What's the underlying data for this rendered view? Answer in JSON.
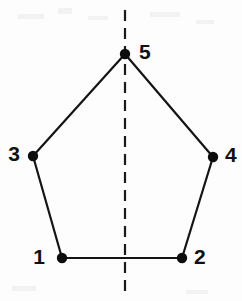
{
  "figure": {
    "background_color": "#fdfdfd",
    "stroke_color": "#141414",
    "vertex_color": "#0d0d0d",
    "axis_color": "#1a1a1a"
  },
  "axis": {
    "name": "mirror-line",
    "style": "dashed",
    "orientation": "vertical",
    "x": 125,
    "y_start": 10,
    "y_end": 293,
    "dash_pattern": "11 7"
  },
  "vertices": [
    {
      "label": "1",
      "x": 62,
      "y": 258,
      "label_x": 45,
      "label_y": 258,
      "label_side": "left"
    },
    {
      "label": "2",
      "x": 182,
      "y": 258,
      "label_x": 194,
      "label_y": 258,
      "label_side": "right"
    },
    {
      "label": "3",
      "x": 33,
      "y": 156,
      "label_x": 20,
      "label_y": 155,
      "label_side": "left"
    },
    {
      "label": "4",
      "x": 213,
      "y": 157,
      "label_x": 225,
      "label_y": 156,
      "label_side": "right"
    },
    {
      "label": "5",
      "x": 125,
      "y": 54,
      "label_x": 139,
      "label_y": 53,
      "label_side": "right"
    }
  ],
  "vertex_radius": 5.2,
  "edges": [
    {
      "name": "edge-1-2",
      "from": "1",
      "to": "2",
      "x1": 62,
      "y1": 258,
      "x2": 182,
      "y2": 258
    },
    {
      "name": "edge-1-3",
      "from": "1",
      "to": "3",
      "x1": 62,
      "y1": 258,
      "x2": 33,
      "y2": 156
    },
    {
      "name": "edge-3-5",
      "from": "3",
      "to": "5",
      "x1": 33,
      "y1": 156,
      "x2": 125,
      "y2": 54
    },
    {
      "name": "edge-5-4",
      "from": "5",
      "to": "4",
      "x1": 125,
      "y1": 54,
      "x2": 213,
      "y2": 157
    },
    {
      "name": "edge-4-2",
      "from": "4",
      "to": "2",
      "x1": 213,
      "y1": 157,
      "x2": 182,
      "y2": 258
    }
  ]
}
